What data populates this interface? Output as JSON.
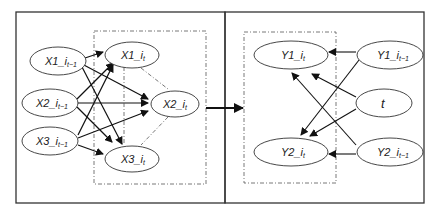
{
  "diagram": {
    "left_panel": {
      "inputs": [
        {
          "id": "x1_prev",
          "main": "X1_",
          "sub": "i",
          "sub2": "t−1"
        },
        {
          "id": "x2_prev",
          "main": "X2_",
          "sub": "i",
          "sub2": "t−1"
        },
        {
          "id": "x3_prev",
          "main": "X3_",
          "sub": "i",
          "sub2": "t−1"
        }
      ],
      "outputs": [
        {
          "id": "x1_t",
          "main": "X1_",
          "sub": "i",
          "sub2": "t"
        },
        {
          "id": "x2_t",
          "main": "X2_",
          "sub": "i",
          "sub2": "t"
        },
        {
          "id": "x3_t",
          "main": "X3_",
          "sub": "i",
          "sub2": "t"
        }
      ]
    },
    "right_panel": {
      "outputs": [
        {
          "id": "y1_t",
          "main": "Y1_",
          "sub": "i",
          "sub2": "t"
        },
        {
          "id": "y2_t",
          "main": "Y2_",
          "sub": "i",
          "sub2": "t"
        }
      ],
      "inputs": [
        {
          "id": "y1_prev",
          "main": "Y1_",
          "sub": "i",
          "sub2": "t−1"
        },
        {
          "id": "t",
          "main": "t",
          "sub": "",
          "sub2": ""
        },
        {
          "id": "y2_prev",
          "main": "Y2_",
          "sub": "i",
          "sub2": "t−1"
        }
      ]
    },
    "colors": {
      "stroke": "#222222",
      "frame": "#333333",
      "dashed": "#555555"
    }
  }
}
